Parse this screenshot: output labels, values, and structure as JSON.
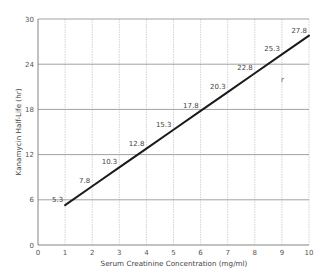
{
  "chart_data": {
    "type": "line",
    "title": "",
    "xlabel": "Serum Creatinine Concentration (mg/ml)",
    "ylabel": "Kanamycin Half-Life (hr)",
    "xlim": [
      0,
      10
    ],
    "ylim": [
      0,
      30
    ],
    "x_ticks": [
      0,
      1,
      2,
      3,
      4,
      5,
      6,
      7,
      8,
      9,
      10
    ],
    "y_ticks": [
      0,
      6,
      12,
      18,
      24,
      30
    ],
    "grid": true,
    "legend": null,
    "series": [
      {
        "name": "Kanamycin half-life",
        "x": [
          1,
          2,
          3,
          4,
          5,
          6,
          7,
          8,
          9,
          10
        ],
        "values": [
          5.3,
          7.8,
          10.3,
          12.8,
          15.3,
          17.8,
          20.3,
          22.8,
          25.3,
          27.8
        ],
        "labels": [
          "5.3",
          "7.8",
          "10.3",
          "12.8",
          "15.3",
          "17.8",
          "20.3",
          "22.8",
          "25.3",
          "27.8"
        ],
        "color": "#1a1a1a"
      }
    ]
  },
  "colors": {
    "line": "#1a1a1a",
    "grid_major": "#8a8a8a",
    "grid_minor": "#c8c8c8",
    "text": "#555555"
  }
}
